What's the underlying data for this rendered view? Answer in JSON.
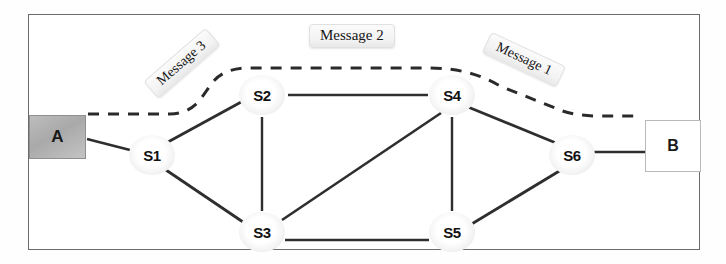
{
  "diagram": {
    "frame": {
      "x": 28,
      "y": 14,
      "width": 672,
      "height": 236,
      "border_color": "#6b6b6b"
    },
    "hosts": [
      {
        "id": "A",
        "label": "A",
        "x": 29,
        "y": 115,
        "width": 57,
        "height": 44,
        "fill": "#b0b0b0",
        "style": "gray-filled"
      },
      {
        "id": "B",
        "label": "B",
        "x": 645,
        "y": 120,
        "width": 56,
        "height": 52,
        "fill": "#ffffff",
        "style": "white-outlined"
      }
    ],
    "switches": [
      {
        "id": "S1",
        "label": "S1",
        "cx": 152,
        "cy": 155
      },
      {
        "id": "S2",
        "label": "S2",
        "cx": 262,
        "cy": 95
      },
      {
        "id": "S3",
        "label": "S3",
        "cx": 262,
        "cy": 232
      },
      {
        "id": "S4",
        "label": "S4",
        "cx": 452,
        "cy": 95
      },
      {
        "id": "S5",
        "label": "S5",
        "cx": 452,
        "cy": 232
      },
      {
        "id": "S6",
        "label": "S6",
        "cx": 572,
        "cy": 155
      }
    ],
    "links": [
      {
        "from": "A",
        "to": "S1",
        "style": "solid"
      },
      {
        "from": "S1",
        "to": "S2",
        "style": "solid"
      },
      {
        "from": "S1",
        "to": "S3",
        "style": "solid"
      },
      {
        "from": "S2",
        "to": "S3",
        "style": "solid"
      },
      {
        "from": "S2",
        "to": "S4",
        "style": "solid"
      },
      {
        "from": "S3",
        "to": "S4",
        "style": "solid"
      },
      {
        "from": "S3",
        "to": "S5",
        "style": "solid"
      },
      {
        "from": "S4",
        "to": "S5",
        "style": "solid"
      },
      {
        "from": "S4",
        "to": "S6",
        "style": "solid"
      },
      {
        "from": "S5",
        "to": "S6",
        "style": "solid"
      },
      {
        "from": "S6",
        "to": "B",
        "style": "solid"
      }
    ],
    "message_path": {
      "style": "dashed",
      "description": "Dashed route from host A over S1, S2, S4 to S6 and host B",
      "color": "#2b2b2b"
    },
    "labels": {
      "message_1": "Message 1",
      "message_2": "Message 2",
      "message_3": "Message 3"
    },
    "label_rotation": {
      "message_1_deg": 25,
      "message_2_deg": 0,
      "message_3_deg": -41
    }
  }
}
